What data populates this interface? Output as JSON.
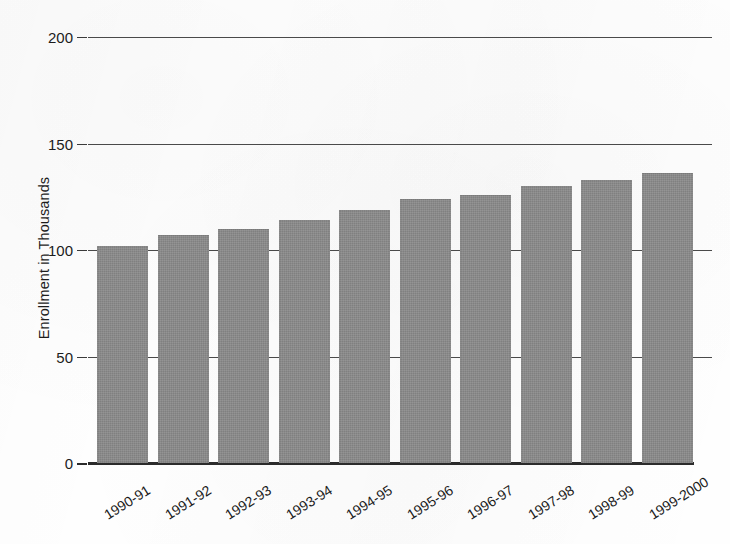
{
  "chart_data": {
    "type": "bar",
    "title": "",
    "xlabel": "",
    "ylabel": "Enrollment in Thousands",
    "categories": [
      "1990-91",
      "1991-92",
      "1992-93",
      "1993-94",
      "1994-95",
      "1995-96",
      "1996-97",
      "1997-98",
      "1998-99",
      "1999-2000"
    ],
    "values": [
      102,
      107,
      110,
      114,
      119,
      124,
      126,
      130,
      133,
      136
    ],
    "ylim": [
      0,
      200
    ],
    "yticks": [
      0,
      50,
      100,
      150,
      200
    ],
    "ytick_labels": [
      "0",
      "50",
      "100",
      "150",
      "200"
    ],
    "grid": true,
    "legend": "none",
    "bar_color": "#8a8a8a",
    "axis_color": "#2b2b2b",
    "gridline_color": "#4a4a4a",
    "background_color": "#fefefe"
  },
  "axis": {
    "y_title": "Enrollment in Thousands"
  }
}
